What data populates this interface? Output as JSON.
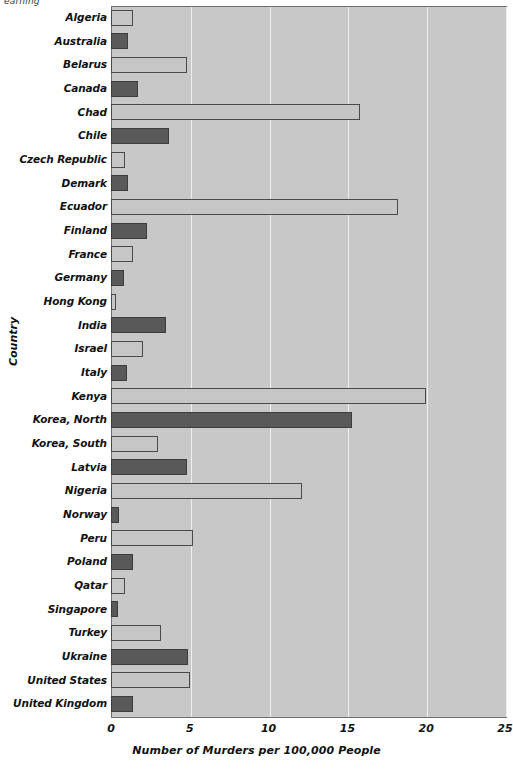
{
  "page": {
    "fragment_text": "earning"
  },
  "chart_data": {
    "type": "bar",
    "orientation": "horizontal",
    "title": "",
    "xlabel": "Number of Murders per 100,000 People",
    "ylabel": "Country",
    "xlim": [
      0,
      25
    ],
    "xticks": [
      0,
      5,
      10,
      15,
      20,
      25
    ],
    "grid": true,
    "legend": "none",
    "plot_background": "#c8c8c8",
    "bar_colors": {
      "light": "#c6c6c6",
      "dark": "#595959"
    },
    "categories": [
      "Algeria",
      "Australia",
      "Belarus",
      "Canada",
      "Chad",
      "Chile",
      "Czech Republic",
      "Demark",
      "Ecuador",
      "Finland",
      "France",
      "Germany",
      "Hong Kong",
      "India",
      "Israel",
      "Italy",
      "Kenya",
      "Korea, North",
      "Korea, South",
      "Latvia",
      "Nigeria",
      "Norway",
      "Peru",
      "Poland",
      "Qatar",
      "Singapore",
      "Turkey",
      "Ukraine",
      "United States",
      "United Kingdom"
    ],
    "values": [
      1.4,
      1.1,
      4.8,
      1.7,
      15.8,
      3.7,
      0.9,
      1.1,
      18.2,
      2.3,
      1.4,
      0.8,
      0.3,
      3.5,
      2.0,
      1.0,
      20.0,
      15.3,
      3.0,
      4.8,
      12.1,
      0.5,
      5.2,
      1.4,
      0.9,
      0.45,
      3.2,
      4.9,
      5.0,
      1.4
    ],
    "bar_styles": [
      "light",
      "dark",
      "light",
      "dark",
      "light",
      "dark",
      "light",
      "dark",
      "light",
      "dark",
      "light",
      "dark",
      "light",
      "dark",
      "light",
      "dark",
      "light",
      "dark",
      "light",
      "dark",
      "light",
      "dark",
      "light",
      "dark",
      "light",
      "dark",
      "light",
      "dark",
      "light",
      "dark"
    ]
  }
}
